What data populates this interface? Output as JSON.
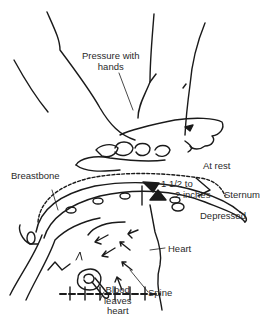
{
  "diagram": {
    "colors": {
      "line": "#1a1a1a",
      "text": "#2a2a2a",
      "background": "#ffffff"
    },
    "labels": {
      "pressure_line1": "Pressure with",
      "pressure_line2": "hands",
      "at_rest": "At rest",
      "breastbone": "Breastbone",
      "depth_line1": "1 1/2 to",
      "depth_line2": "2 inches",
      "sternum": "Sternum",
      "depressed": "Depressed",
      "heart": "Heart",
      "blood_line1": "Blood",
      "blood_line2": "leaves",
      "blood_line3": "heart",
      "spine": "Spine"
    }
  }
}
